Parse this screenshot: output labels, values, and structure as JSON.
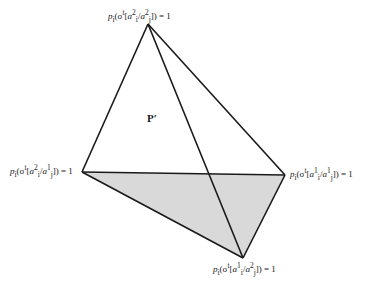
{
  "diagram": {
    "type": "simplex-tetrahedron",
    "colors": {
      "stroke": "#1a1a1a",
      "shade": "#d9d9d9",
      "background": "#ffffff"
    },
    "vertices": {
      "top": {
        "x": 148,
        "y": 24,
        "label": "p_i(σ^t[a_i^2/a_j^2]) = 1"
      },
      "left": {
        "x": 82,
        "y": 172,
        "label": "p_i(σ^t[a_i^2/a_j^1]) = 1"
      },
      "right": {
        "x": 285,
        "y": 175,
        "label": "p_i(σ^t[a_i^1/a_j^1]) = 1"
      },
      "bottom": {
        "x": 243,
        "y": 258,
        "label": "p_i(σ^t[a_i^1/a_j^2]) = 1"
      }
    },
    "region_label": "P′",
    "shaded_face": [
      "left",
      "right",
      "bottom"
    ]
  },
  "labels": {
    "top": {
      "p": "p",
      "sub": "i",
      "open": "(σ",
      "sup_t": "t",
      "a1": "a",
      "a1_sup": "2",
      "a1_sub": "i",
      "slash": "/",
      "a2": "a",
      "a2_sup": "2",
      "a2_sub": "j",
      "close": "]) = 1"
    },
    "left": {
      "p": "p",
      "sub": "i",
      "open": "(σ",
      "sup_t": "t",
      "a1": "a",
      "a1_sup": "2",
      "a1_sub": "i",
      "slash": "/",
      "a2": "a",
      "a2_sup": "1",
      "a2_sub": "j",
      "close": "]) = 1"
    },
    "right": {
      "p": "p",
      "sub": "i",
      "open": "(σ",
      "sup_t": "t",
      "a1": "a",
      "a1_sup": "1",
      "a1_sub": "i",
      "slash": "/",
      "a2": "a",
      "a2_sup": "1",
      "a2_sub": "j",
      "close": "]) = 1"
    },
    "bottom": {
      "p": "p",
      "sub": "i",
      "open": "(σ",
      "sup_t": "t",
      "a1": "a",
      "a1_sup": "1",
      "a1_sub": "i",
      "slash": "/",
      "a2": "a",
      "a2_sup": "2",
      "a2_sub": "j",
      "close": "]) = 1"
    },
    "region": "P′"
  }
}
